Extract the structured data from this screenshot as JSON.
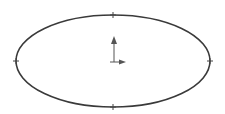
{
  "canvas": {
    "width": 225,
    "height": 114,
    "background": "#ffffff"
  },
  "ellipse": {
    "cx": 113,
    "cy": 61,
    "rx": 97,
    "ry": 46,
    "stroke": "#3a3a3a",
    "stroke_width": 1.6
  },
  "points": [
    {
      "name": "top-point",
      "x": 113,
      "y": 15
    },
    {
      "name": "bottom-point",
      "x": 113,
      "y": 107
    },
    {
      "name": "left-point",
      "x": 16,
      "y": 61
    },
    {
      "name": "right-point",
      "x": 210,
      "y": 61
    }
  ],
  "origin": {
    "x": 113,
    "y": 61,
    "color": "#555555"
  }
}
